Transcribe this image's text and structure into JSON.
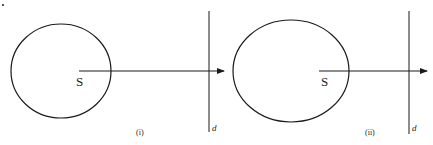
{
  "figure": {
    "panels": [
      {
        "id": "i",
        "caption": "(i)",
        "source_label": "S",
        "line_label": "d",
        "stroke_color": "#1a1a1a"
      },
      {
        "id": "ii",
        "caption": "(ii)",
        "source_label": "S",
        "line_label": "d",
        "stroke_color": "#1a1a1a"
      }
    ]
  }
}
